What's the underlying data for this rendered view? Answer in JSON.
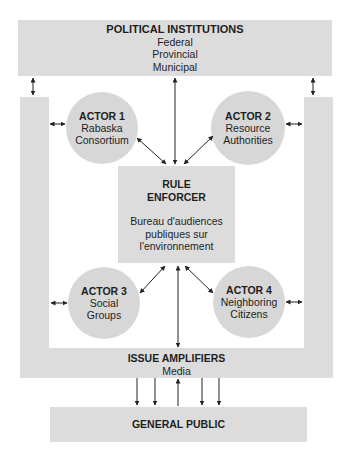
{
  "political_institutions": {
    "title": "POLITICAL INSTITUTIONS",
    "levels": [
      "Federal",
      "Provincial",
      "Municipal"
    ]
  },
  "actors": [
    {
      "label": "ACTOR 1",
      "name_lines": [
        "Rabaska",
        "Consortium"
      ]
    },
    {
      "label": "ACTOR 2",
      "name_lines": [
        "Resource",
        "Authorities"
      ]
    },
    {
      "label": "ACTOR 3",
      "name_lines": [
        "Social",
        "Groups"
      ]
    },
    {
      "label": "ACTOR 4",
      "name_lines": [
        "Neighboring",
        "Citizens"
      ]
    }
  ],
  "rule_enforcer": {
    "title_lines": [
      "RULE",
      "ENFORCER"
    ],
    "body_lines": [
      "Bureau d'audiences",
      "publiques sur",
      "l'environnement"
    ]
  },
  "issue_amplifiers": {
    "title": "ISSUE AMPLIFIERS",
    "subtitle": "Media"
  },
  "general_public": {
    "title": "GENERAL PUBLIC"
  },
  "colors": {
    "band_fill": "#dcdcdc",
    "circle_fill": "#d7d7d7",
    "text": "#1e1e1e",
    "arrow": "#222222"
  }
}
